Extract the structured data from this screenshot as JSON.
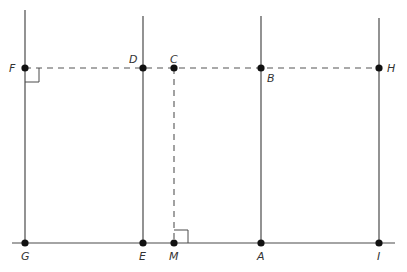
{
  "diagram": {
    "type": "geometry",
    "colors": {
      "line": "#4a4a4a",
      "point": "#111111",
      "label": "#333333",
      "background": "#ffffff"
    },
    "points": [
      {
        "id": "F",
        "label": "F",
        "x": 25,
        "y": 68
      },
      {
        "id": "D",
        "label": "D",
        "x": 143,
        "y": 68
      },
      {
        "id": "C",
        "label": "C",
        "x": 174,
        "y": 68
      },
      {
        "id": "B",
        "label": "B",
        "x": 261,
        "y": 68
      },
      {
        "id": "H",
        "label": "H",
        "x": 379,
        "y": 68
      },
      {
        "id": "G",
        "label": "G",
        "x": 25,
        "y": 243
      },
      {
        "id": "E",
        "label": "E",
        "x": 143,
        "y": 243
      },
      {
        "id": "M",
        "label": "M",
        "x": 174,
        "y": 243
      },
      {
        "id": "A",
        "label": "A",
        "x": 261,
        "y": 243
      },
      {
        "id": "I",
        "label": "I",
        "x": 379,
        "y": 243
      }
    ],
    "solid_lines": [
      {
        "name": "line-GF",
        "x1": 25,
        "y1": 10,
        "x2": 25,
        "y2": 243
      },
      {
        "name": "line-ED",
        "x1": 143,
        "y1": 16,
        "x2": 143,
        "y2": 243
      },
      {
        "name": "line-AB",
        "x1": 261,
        "y1": 16,
        "x2": 261,
        "y2": 243
      },
      {
        "name": "line-IH",
        "x1": 379,
        "y1": 18,
        "x2": 379,
        "y2": 243
      },
      {
        "name": "line-GI",
        "x1": 12,
        "y1": 243,
        "x2": 395,
        "y2": 243
      }
    ],
    "dashed_lines": [
      {
        "name": "dashed-FH",
        "x1": 25,
        "y1": 68,
        "x2": 379,
        "y2": 68
      },
      {
        "name": "dashed-CM",
        "x1": 174,
        "y1": 68,
        "x2": 174,
        "y2": 243
      }
    ],
    "right_angles": [
      {
        "name": "right-angle-F",
        "at": "F"
      },
      {
        "name": "right-angle-M",
        "at": "M"
      }
    ]
  }
}
